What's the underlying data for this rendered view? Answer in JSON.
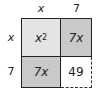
{
  "diagram": {
    "top_labels": [
      "x",
      "7"
    ],
    "side_labels": [
      "x",
      "7"
    ],
    "cells": {
      "top_left": {
        "base": "x",
        "exp": "2",
        "fill": "#e4e4e4"
      },
      "top_right": {
        "text": "7x",
        "fill": "#c9c9c9"
      },
      "bottom_left": {
        "text": "7x",
        "fill": "#c9c9c9"
      },
      "bottom_right": {
        "text": "49",
        "fill": "#ffffff",
        "border": "dashed"
      }
    }
  }
}
